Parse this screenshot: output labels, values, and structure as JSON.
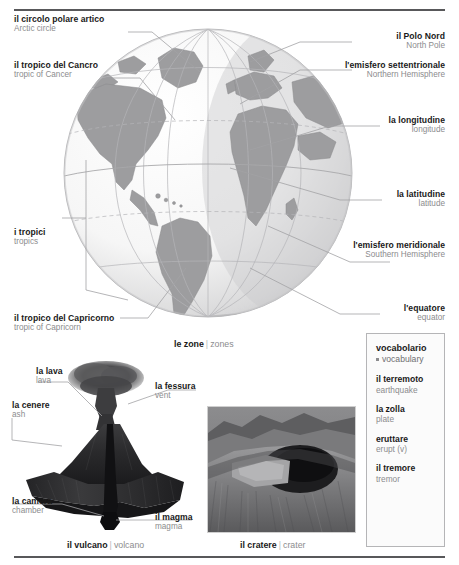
{
  "rules": {
    "top": true,
    "bottom": true
  },
  "globe": {
    "caption": {
      "it": "le zone",
      "sep": "|",
      "en": "zones"
    },
    "labels": [
      {
        "id": "arctic-circle",
        "it": "il circolo polare artico",
        "en": "Arctic circle"
      },
      {
        "id": "tropic-cancer",
        "it": "il tropico del Cancro",
        "en": "tropic of Cancer"
      },
      {
        "id": "tropics",
        "it": "i tropici",
        "en": "tropics"
      },
      {
        "id": "tropic-capricorn",
        "it": "il tropico del Capricorno",
        "en": "tropic of Capricorn"
      },
      {
        "id": "north-pole",
        "it": "il Polo Nord",
        "en": "North Pole"
      },
      {
        "id": "northern-hemisphere",
        "it": "l'emisfero settentrionale",
        "en": "Northern Hemisphere"
      },
      {
        "id": "longitude",
        "it": "la longitudine",
        "en": "longitude"
      },
      {
        "id": "latitude",
        "it": "la latitudine",
        "en": "latitude"
      },
      {
        "id": "southern-hemisphere",
        "it": "l'emisfero meridionale",
        "en": "Southern Hemisphere"
      },
      {
        "id": "equator",
        "it": "l'equatore",
        "en": "equator"
      }
    ]
  },
  "volcano": {
    "caption": {
      "it": "il vulcano",
      "sep": "|",
      "en": "volcano"
    },
    "labels": [
      {
        "id": "lava",
        "it": "la lava",
        "en": "lava"
      },
      {
        "id": "vent",
        "it": "la fessura",
        "en": "vent"
      },
      {
        "id": "ash",
        "it": "la cenere",
        "en": "ash"
      },
      {
        "id": "chamber",
        "it": "la camera",
        "en": "chamber"
      },
      {
        "id": "magma",
        "it": "il magma",
        "en": "magma"
      }
    ]
  },
  "crater": {
    "caption": {
      "it": "il cratere",
      "sep": "|",
      "en": "crater"
    }
  },
  "vocabulary": {
    "title_it": "vocabolario",
    "title_en": "vocabulary",
    "entries": [
      {
        "it": "il terremoto",
        "en": "earthquake"
      },
      {
        "it": "la zolla",
        "en": "plate"
      },
      {
        "it": "eruttare",
        "en": "erupt (v)"
      },
      {
        "it": "il tremore",
        "en": "tremor"
      }
    ]
  },
  "colors": {
    "rule": "#58585a",
    "italian_text": "#1a1a1a",
    "english_text": "#8c8c8e",
    "leader": "#a2a2a4",
    "globe_land": "#9d9d9f",
    "globe_ocean": "#f2f2f2",
    "globe_shadow": "#b9b9bb",
    "vocab_border": "#b5b5b7"
  }
}
